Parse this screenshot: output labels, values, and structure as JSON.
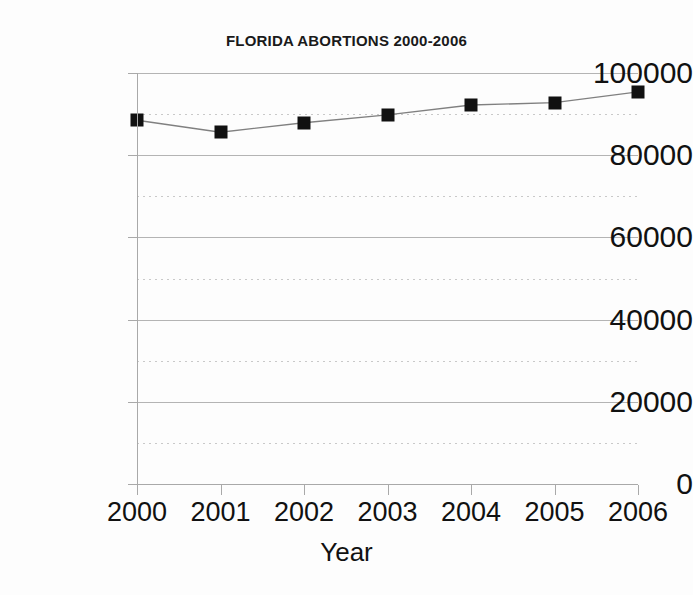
{
  "chart_data": {
    "type": "line",
    "title": "FLORIDA ABORTIONS 2000-2006",
    "xlabel": "Year",
    "ylabel": "",
    "categories": [
      "2000",
      "2001",
      "2002",
      "2003",
      "2004",
      "2005",
      "2006"
    ],
    "values": [
      88500,
      85600,
      87900,
      89800,
      92200,
      92800,
      95400
    ],
    "series": [
      {
        "name": "Florida abortions",
        "values": [
          88500,
          85600,
          87900,
          89800,
          92200,
          92800,
          95400
        ]
      }
    ],
    "xlim": [
      2000,
      2006
    ],
    "ylim": [
      0,
      100000
    ],
    "y_ticks": [
      "0",
      "20000",
      "40000",
      "60000",
      "80000",
      "100000"
    ],
    "y_tick_values": [
      0,
      20000,
      40000,
      60000,
      80000,
      100000
    ],
    "y_minor_tick_values": [
      10000,
      30000,
      50000,
      70000,
      90000
    ],
    "x_ticks": [
      "2000",
      "2001",
      "2002",
      "2003",
      "2004",
      "2005",
      "2006"
    ],
    "grid": "major-solid-and-minor-dotted",
    "legend": "none",
    "marker": "square",
    "colors": {
      "line": "#808080",
      "marker": "#111111",
      "grid_major": "#b4b4b4",
      "grid_minor": "#c9c9c9",
      "axis": "#a9a9a9",
      "text": "#111111",
      "background": "#fdfdfd"
    }
  }
}
